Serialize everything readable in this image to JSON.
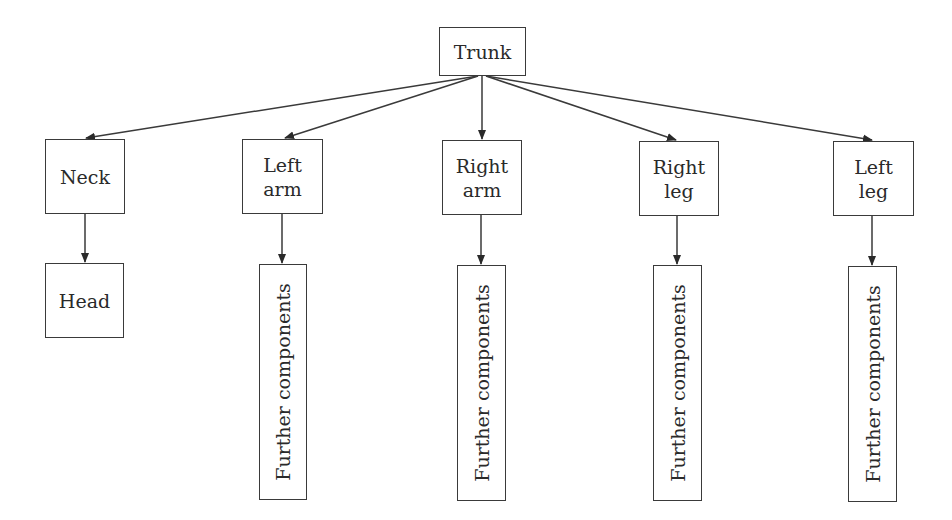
{
  "diagram": {
    "type": "hierarchy-tree",
    "root": {
      "id": "trunk",
      "label": "Trunk"
    },
    "children": [
      {
        "id": "neck",
        "label": "Neck",
        "child": {
          "id": "head",
          "label": "Head"
        }
      },
      {
        "id": "left-arm",
        "label": "Left\narm",
        "child": {
          "id": "left-arm-further",
          "label": "Further components"
        }
      },
      {
        "id": "right-arm",
        "label": "Right\narm",
        "child": {
          "id": "right-arm-further",
          "label": "Further components"
        }
      },
      {
        "id": "right-leg",
        "label": "Right\nleg",
        "child": {
          "id": "right-leg-further",
          "label": "Further components"
        }
      },
      {
        "id": "left-leg",
        "label": "Left\nleg",
        "child": {
          "id": "left-leg-further",
          "label": "Further components"
        }
      }
    ],
    "colors": {
      "line": "#3a3a3a",
      "text": "#2a2a2a",
      "background": "#ffffff"
    }
  }
}
